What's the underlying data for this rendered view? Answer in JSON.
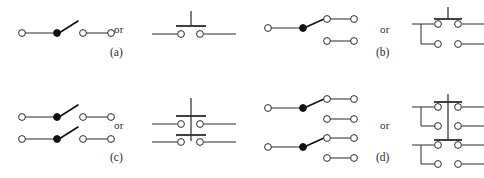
{
  "figure": {
    "connector_word": "or",
    "ink_color": "#2b2b2b",
    "pivot_color": "#111111",
    "terminal_fill": "#ffffff",
    "background": "#ffffff"
  },
  "panels": [
    {
      "id": "a",
      "label": "(a)",
      "connector": "or",
      "switch_type": "SPST",
      "poles": 1,
      "throws": 1,
      "left_symbol": {
        "name": "spst-lever-switch",
        "terminals": 4,
        "pivots": 1,
        "blades": 1,
        "rows": 1,
        "state": "open"
      },
      "right_symbol": {
        "name": "spst-pushbutton-switch",
        "contact_pairs": 1,
        "actuator_bars": 1,
        "stems": 1
      }
    },
    {
      "id": "b",
      "label": "(b)",
      "connector": "or",
      "switch_type": "SPDT",
      "poles": 1,
      "throws": 2,
      "left_symbol": {
        "name": "spdt-lever-switch",
        "terminals": 6,
        "pivots": 1,
        "blades": 1,
        "rows": 2,
        "state": "upper-closed"
      },
      "right_symbol": {
        "name": "spdt-pushbutton-switch",
        "contact_pairs": 2,
        "actuator_bars": 1,
        "stems": 1,
        "bus_wires": 1
      }
    },
    {
      "id": "c",
      "label": "(c)",
      "connector": "or",
      "switch_type": "DPST",
      "poles": 2,
      "throws": 1,
      "left_symbol": {
        "name": "dpst-lever-switch",
        "terminals": 8,
        "pivots": 2,
        "blades": 2,
        "rows": 2,
        "state": "open"
      },
      "right_symbol": {
        "name": "dpst-pushbutton-switch",
        "contact_pairs": 2,
        "actuator_bars": 2,
        "stems": 1,
        "ganged": true
      }
    },
    {
      "id": "d",
      "label": "(d)",
      "connector": "or",
      "switch_type": "DPDT",
      "poles": 2,
      "throws": 2,
      "left_symbol": {
        "name": "dpdt-lever-switch",
        "terminals": 12,
        "pivots": 2,
        "blades": 2,
        "rows": 4,
        "state": "upper-closed"
      },
      "right_symbol": {
        "name": "dpdt-pushbutton-switch",
        "contact_pairs": 4,
        "actuator_bars": 2,
        "stems": 1,
        "bus_wires": 2,
        "ganged": true
      }
    }
  ]
}
